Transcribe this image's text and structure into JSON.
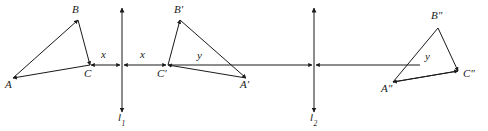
{
  "figure": {
    "stroke_color": "#1a1a1a",
    "background_color": "#ffffff",
    "width": 488,
    "height": 131
  },
  "mirror_lines": [
    {
      "id": "l1",
      "label": "l",
      "subscript": "1",
      "x": 122,
      "y_top": 8,
      "y_bottom": 112,
      "label_x": 118,
      "label_y": 114
    },
    {
      "id": "l2",
      "label": "l",
      "subscript": "2",
      "x": 314,
      "y_top": 8,
      "y_bottom": 112,
      "label_x": 310,
      "label_y": 114
    }
  ],
  "triangles": [
    {
      "id": "ABC",
      "name": "original-triangle",
      "vertices": [
        {
          "label": "A",
          "x": 13,
          "y": 78,
          "label_x": 5,
          "label_y": 82
        },
        {
          "label": "B",
          "x": 78,
          "y": 20,
          "label_x": 72,
          "label_y": 6
        },
        {
          "label": "C",
          "x": 90,
          "y": 65,
          "label_x": 84,
          "label_y": 69
        }
      ],
      "interior_label": null
    },
    {
      "id": "A'B'C'",
      "name": "first-reflection-triangle",
      "vertices": [
        {
          "label": "C'",
          "x": 168,
          "y": 65,
          "label_x": 159,
          "label_y": 69
        },
        {
          "label": "B'",
          "x": 180,
          "y": 20,
          "label_x": 174,
          "label_y": 6
        },
        {
          "label": "A'",
          "x": 246,
          "y": 78,
          "label_x": 240,
          "label_y": 82
        }
      ],
      "interior_label": {
        "text": "y",
        "x": 200,
        "y": 52
      }
    },
    {
      "id": "A\"B\"C\"",
      "name": "second-reflection-triangle",
      "vertices": [
        {
          "label": "A\"",
          "x": 393,
          "y": 82,
          "label_x": 384,
          "label_y": 86
        },
        {
          "label": "B\"",
          "x": 438,
          "y": 28,
          "label_x": 432,
          "label_y": 13
        },
        {
          "label": "C\"",
          "x": 458,
          "y": 71,
          "label_x": 463,
          "label_y": 74
        }
      ],
      "interior_label": {
        "text": "y",
        "x": 428,
        "y": 58
      }
    }
  ],
  "measures": [
    {
      "id": "x-left",
      "text": "x",
      "x": 103,
      "y": 52,
      "from_x": 91,
      "to_x": 120,
      "axis_y": 65
    },
    {
      "id": "x-right",
      "text": "x",
      "x": 141,
      "y": 52,
      "from_x": 124,
      "to_x": 167,
      "axis_y": 65
    },
    {
      "id": "y-left",
      "text": "y",
      "x": 200,
      "y": 52,
      "from_x": 169,
      "to_x": 312,
      "axis_y": 65
    },
    {
      "id": "y-right",
      "text": "y",
      "x": 428,
      "y": 58,
      "from_x": 316,
      "to_x": 420,
      "axis_y": 65
    }
  ],
  "labels_flat": {
    "A": "A",
    "B": "B",
    "C": "C",
    "A_prime": "A'",
    "B_prime": "B'",
    "C_prime": "C'",
    "A_double": "A\"",
    "B_double": "B\"",
    "C_double": "C\"",
    "x_left": "x",
    "x_right": "x",
    "y_middle": "y",
    "y_right": "y",
    "l1_base": "l",
    "l1_sub": "1",
    "l2_base": "l",
    "l2_sub": "2"
  }
}
